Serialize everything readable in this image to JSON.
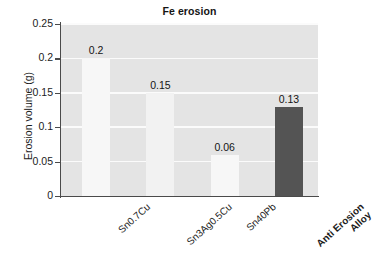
{
  "chart_data": {
    "type": "bar",
    "title": "Fe erosion",
    "xlabel": "",
    "ylabel": "Erosion volume (g)",
    "categories": [
      "Sn0.7Cu",
      "Sn3Ag0.5Cu",
      "Sn40Pb",
      "Anti Erosion Alloy"
    ],
    "values": [
      0.2,
      0.15,
      0.06,
      0.13
    ],
    "value_labels": [
      "0.2",
      "0.15",
      "0.06",
      "0.13"
    ],
    "ylim": [
      0,
      0.25
    ],
    "yticks": [
      0,
      0.05,
      0.1,
      0.15,
      0.2,
      0.25
    ],
    "ytick_labels": [
      "0",
      "0.05",
      "0.1",
      "0.15",
      "0.2",
      "0.25"
    ],
    "grid": true,
    "legend": false,
    "bar_colors": [
      "#f7f7f7",
      "#f2f2f2",
      "#f7f7f7",
      "#545454"
    ],
    "plot_background": "#e4e4e4",
    "gridline_color": "#fbfbfb",
    "axis_color": "#4a4a4a",
    "figure_background": "#ffffff",
    "highlight_category": "Anti Erosion Alloy"
  },
  "axis": {
    "y_title": "Erosion volume (g)",
    "ticks": [
      {
        "label": "0.25",
        "value": 0.25
      },
      {
        "label": "0.2",
        "value": 0.2
      },
      {
        "label": "0.15",
        "value": 0.15
      },
      {
        "label": "0.1",
        "value": 0.1
      },
      {
        "label": "0.05",
        "value": 0.05
      },
      {
        "label": "0",
        "value": 0
      }
    ]
  },
  "bars": [
    {
      "category": "Sn0.7Cu",
      "label_line1": "Sn0.7Cu",
      "label_line2": "",
      "value": 0.2,
      "value_label": "0.2",
      "bold": false
    },
    {
      "category": "Sn3Ag0.5Cu",
      "label_line1": "Sn3Ag0.5Cu",
      "label_line2": "",
      "value": 0.15,
      "value_label": "0.15",
      "bold": false
    },
    {
      "category": "Sn40Pb",
      "label_line1": "Sn40Pb",
      "label_line2": "",
      "value": 0.06,
      "value_label": "0.06",
      "bold": false
    },
    {
      "category": "Anti Erosion Alloy",
      "label_line1": "Anti Erosion",
      "label_line2": "Alloy",
      "value": 0.13,
      "value_label": "0.13",
      "bold": true
    }
  ],
  "title": {
    "text": "Fe erosion"
  }
}
